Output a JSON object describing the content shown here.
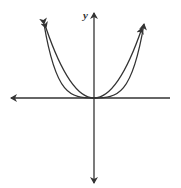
{
  "diagram": {
    "axis_label_y": "y",
    "curves": [
      {
        "name": "x-squared",
        "description": "parabola y = x^2"
      },
      {
        "name": "x-fourth",
        "description": "quartic y = x^4"
      }
    ],
    "colors": {
      "stroke": "#333333",
      "background": "#ffffff"
    }
  }
}
